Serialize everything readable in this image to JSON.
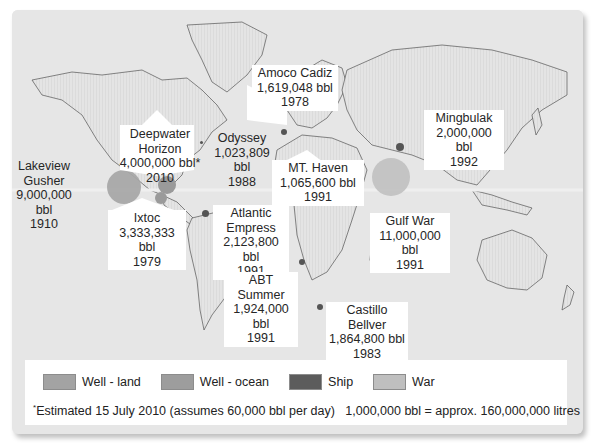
{
  "map": {
    "title": "World oil spills map",
    "spills": [
      {
        "name": "Lakeview Gusher",
        "line1": "Lakeview",
        "line2": "Gusher",
        "volume": "9,000,000 bbl",
        "year": "1910",
        "type": "Well - land"
      },
      {
        "name": "Deepwater Horizon",
        "line1": "Deepwater",
        "line2": "Horizon",
        "volume": "4,000,000 bbl*",
        "year": "2010",
        "type": "Well - ocean"
      },
      {
        "name": "Odyssey",
        "line1": "Odyssey",
        "volume": "1,023,809 bbl",
        "year": "1988",
        "type": "Ship"
      },
      {
        "name": "Amoco Cadiz",
        "line1": "Amoco Cadiz",
        "volume": "1,619,048 bbl",
        "year": "1978",
        "type": "Ship"
      },
      {
        "name": "Mingbulak",
        "line1": "Mingbulak",
        "volume": "2,000,000 bbl",
        "year": "1992",
        "type": "Well - land"
      },
      {
        "name": "MT. Haven",
        "line1": "MT. Haven",
        "volume": "1,065,600 bbl",
        "year": "1991",
        "type": "Ship"
      },
      {
        "name": "Ixtoc",
        "line1": "Ixtoc",
        "volume": "3,333,333 bbl",
        "year": "1979",
        "type": "Well - ocean"
      },
      {
        "name": "Atlantic Empress",
        "line1": "Atlantic",
        "line2": "Empress",
        "volume": "2,123,800 bbl",
        "year": "1991",
        "type": "Ship"
      },
      {
        "name": "Gulf War",
        "line1": "Gulf War",
        "volume": "11,000,000 bbl",
        "year": "1991",
        "type": "War"
      },
      {
        "name": "ABT Summer",
        "line1": "ABT Summer",
        "volume": "1,924,000 bbl",
        "year": "1991",
        "type": "Ship"
      },
      {
        "name": "Castillo Bellver",
        "line1": "Castillo Bellver",
        "volume": "1,864,800 bbl",
        "year": "1983",
        "type": "Ship"
      }
    ]
  },
  "legend": {
    "items": [
      {
        "label": "Well - land",
        "color": "#a3a3a3"
      },
      {
        "label": "Well - ocean",
        "color": "#9d9d9d"
      },
      {
        "label": "Ship",
        "color": "#5c5c5c"
      },
      {
        "label": "War",
        "color": "#bfbfbf"
      }
    ],
    "footnote_mark": "*",
    "footnote": "Estimated 15 July 2010 (assumes 60,000 bbl per day)   1,000,000 bbl = approx. 160,000,000 litres of oil"
  }
}
